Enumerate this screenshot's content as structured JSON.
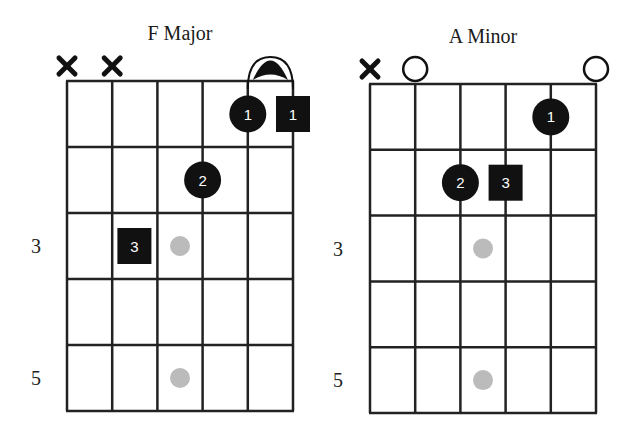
{
  "colors": {
    "line": "#222222",
    "finger": "#111111",
    "finger_text": "#ffffff",
    "marker": "#bbbbbb",
    "background": "#ffffff"
  },
  "chart_data": {
    "type": "chord-diagrams",
    "diagrams": [
      {
        "title": "F Major",
        "strings": 6,
        "frets_shown": 5,
        "fret_labels": [
          {
            "fret": 3,
            "label": "3"
          },
          {
            "fret": 5,
            "label": "5"
          }
        ],
        "string_markers": [
          {
            "string": 1,
            "type": "muted",
            "symbol": "×"
          },
          {
            "string": 2,
            "type": "muted",
            "symbol": "×"
          }
        ],
        "barre": {
          "from_string": 5,
          "to_string": 6,
          "fret": 1
        },
        "fingers": [
          {
            "string": 5,
            "fret": 1,
            "finger": "1",
            "shape": "circle"
          },
          {
            "string": 6,
            "fret": 1,
            "finger": "1",
            "shape": "square",
            "offset": true
          },
          {
            "string": 4,
            "fret": 2,
            "finger": "2",
            "shape": "circle"
          },
          {
            "string": 3,
            "fret": 3,
            "finger": "3",
            "shape": "square",
            "offset": "left"
          }
        ],
        "inlay_markers": [
          {
            "fret": 3
          },
          {
            "fret": 5
          }
        ]
      },
      {
        "title": "A Minor",
        "strings": 6,
        "frets_shown": 5,
        "fret_labels": [
          {
            "fret": 3,
            "label": "3"
          },
          {
            "fret": 5,
            "label": "5"
          }
        ],
        "string_markers": [
          {
            "string": 1,
            "type": "muted",
            "symbol": "×"
          },
          {
            "string": 2,
            "type": "open",
            "symbol": "○"
          },
          {
            "string": 6,
            "type": "open",
            "symbol": "○"
          }
        ],
        "barre": null,
        "fingers": [
          {
            "string": 5,
            "fret": 1,
            "finger": "1",
            "shape": "circle"
          },
          {
            "string": 3,
            "fret": 2,
            "finger": "2",
            "shape": "circle"
          },
          {
            "string": 4,
            "fret": 2,
            "finger": "3",
            "shape": "square"
          }
        ],
        "inlay_markers": [
          {
            "fret": 3
          },
          {
            "fret": 5
          }
        ]
      }
    ]
  }
}
